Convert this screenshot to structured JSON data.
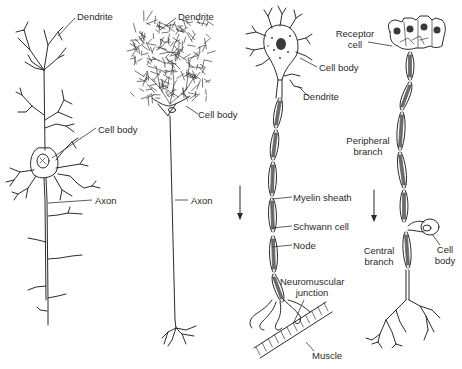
{
  "figure": {
    "panels": [
      {
        "id": "multipolar-interneuron",
        "labels": {
          "dendrite": "Dendrite",
          "cell_body": "Cell body",
          "axon": "Axon"
        }
      },
      {
        "id": "purkinje-neuron",
        "labels": {
          "dendrite": "Dendrite",
          "cell_body": "Cell body",
          "axon": "Axon"
        }
      },
      {
        "id": "motor-neuron",
        "labels": {
          "cell_body": "Cell body",
          "dendrite": "Dendrite",
          "myelin_sheath": "Myelin sheath",
          "schwann_cell": "Schwann cell",
          "node": "Node",
          "neuromuscular_junction_1": "Neuromuscular",
          "neuromuscular_junction_2": "junction",
          "muscle": "Muscle"
        },
        "arrow_direction": "down"
      },
      {
        "id": "sensory-neuron",
        "labels": {
          "receptor_cell_1": "Receptor",
          "receptor_cell_2": "cell",
          "peripheral_branch_1": "Peripheral",
          "peripheral_branch_2": "branch",
          "central_branch_1": "Central",
          "central_branch_2": "branch",
          "cell_body_1": "Cell",
          "cell_body_2": "body"
        },
        "arrow_direction": "down"
      }
    ]
  }
}
